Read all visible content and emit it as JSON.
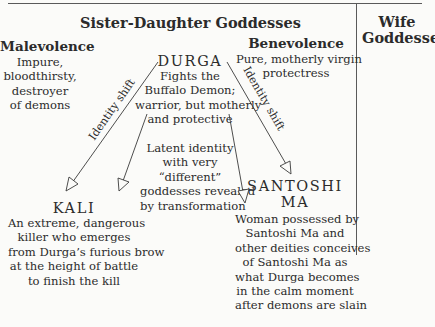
{
  "headers": {
    "sister_daughter": "Sister-Daughter Goddesses",
    "wife": [
      "Wife",
      "Goddesses"
    ]
  },
  "malevolence": {
    "title": "Malevolence",
    "lines": [
      "Impure,",
      "bloodthirsty,",
      "destroyer",
      "of demons"
    ]
  },
  "benevolence": {
    "title": "Benevolence",
    "lines": [
      "Pure, motherly virgin",
      "protectress"
    ]
  },
  "durga": {
    "name": "DURGA",
    "lines": [
      "Fights the",
      "Buffalo Demon;",
      "warrior, but motherly",
      "and protective"
    ]
  },
  "latent": {
    "lines": [
      "Latent identity",
      "with very",
      "“different”",
      "goddesses revealed",
      "by transformation"
    ]
  },
  "kali": {
    "name": "KALI",
    "lines": [
      "An extreme, dangerous",
      "killer who emerges",
      "from Durga’s furious brow",
      "at the height of battle",
      "to finish the kill"
    ]
  },
  "santoshi": {
    "name": [
      "SANTOSHI",
      "MA"
    ],
    "lines": [
      "Woman possessed by",
      "Santoshi Ma and",
      "other deities conceives",
      "of Santoshi Ma as",
      "what Durga becomes",
      "in the calm moment",
      "after demons are slain"
    ]
  },
  "arrows": {
    "left_label": "Identity shift",
    "right_label": "Identity shift"
  }
}
